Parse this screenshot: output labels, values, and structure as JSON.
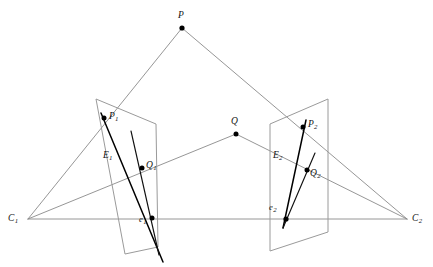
{
  "figure": {
    "type": "geometry-diagram",
    "width": 433,
    "height": 267,
    "background_color": "#ffffff",
    "stroke_color_structure": "#8a8a8a",
    "stroke_color_epipolar": "#000000"
  },
  "labels": {
    "P": {
      "text": "P",
      "sub": ""
    },
    "Q": {
      "text": "Q",
      "sub": ""
    },
    "C1": {
      "text": "C",
      "sub": "1"
    },
    "C2": {
      "text": "C",
      "sub": "2"
    },
    "P1": {
      "text": "P",
      "sub": "1"
    },
    "P2": {
      "text": "P",
      "sub": "2"
    },
    "Q1": {
      "text": "Q",
      "sub": "1"
    },
    "Q2": {
      "text": "Q",
      "sub": "2"
    },
    "E1": {
      "text": "E",
      "sub": "1"
    },
    "E2": {
      "text": "E",
      "sub": "2"
    },
    "e1": {
      "text": "e",
      "sub": "1"
    },
    "e2": {
      "text": "e",
      "sub": "2"
    }
  },
  "points": {
    "P": {
      "x": 182,
      "y": 28,
      "dot": true
    },
    "Q": {
      "x": 236,
      "y": 134,
      "dot": true
    },
    "C1": {
      "x": 28,
      "y": 219,
      "dot": false
    },
    "C2": {
      "x": 407,
      "y": 219,
      "dot": false
    },
    "P1": {
      "x": 104,
      "y": 118,
      "dot": true
    },
    "Q1": {
      "x": 142,
      "y": 168,
      "dot": true
    },
    "e1": {
      "x": 152,
      "y": 218,
      "dot": true
    },
    "P2": {
      "x": 303,
      "y": 127,
      "dot": true
    },
    "Q2": {
      "x": 307,
      "y": 170,
      "dot": true
    },
    "e2": {
      "x": 286,
      "y": 219,
      "dot": true
    }
  },
  "planes": {
    "left_image_plane": {
      "name": "left-image-plane",
      "corners": [
        [
          96,
          99
        ],
        [
          156,
          124
        ],
        [
          158,
          247
        ],
        [
          125,
          254
        ]
      ]
    },
    "right_image_plane": {
      "name": "right-image-plane",
      "corners": [
        [
          270,
          124
        ],
        [
          328,
          99
        ],
        [
          328,
          232
        ],
        [
          270,
          251
        ]
      ]
    }
  },
  "structure_lines": [
    {
      "name": "ray-C1-to-P",
      "from": [
        28,
        219
      ],
      "to": [
        182,
        28
      ]
    },
    {
      "name": "ray-C2-to-P",
      "from": [
        407,
        219
      ],
      "to": [
        182,
        28
      ]
    },
    {
      "name": "ray-C1-to-Q",
      "from": [
        28,
        219
      ],
      "to": [
        236,
        134
      ]
    },
    {
      "name": "ray-C2-to-Q",
      "from": [
        407,
        219
      ],
      "to": [
        236,
        134
      ]
    },
    {
      "name": "baseline-C1-C2",
      "from": [
        28,
        219
      ],
      "to": [
        407,
        219
      ]
    }
  ],
  "epipolar_lines": [
    {
      "name": "epipolar-line-E1",
      "from": [
        101,
        113
      ],
      "to": [
        163,
        262
      ],
      "thick": true
    },
    {
      "name": "epipolar-line-E2",
      "from": [
        283,
        228
      ],
      "to": [
        306,
        120
      ],
      "thick": true
    },
    {
      "name": "line-Q1-to-e1",
      "from": [
        131,
        131
      ],
      "to": [
        159,
        255
      ],
      "thick": false
    },
    {
      "name": "line-e2-to-Q2",
      "from": [
        283,
        228
      ],
      "to": [
        315,
        153
      ],
      "thick": false
    }
  ],
  "label_positions": {
    "P": {
      "x": 178,
      "y": 11
    },
    "Q": {
      "x": 231,
      "y": 117
    },
    "C1": {
      "x": 11,
      "y": 219
    },
    "C2": {
      "x": 412,
      "y": 219
    },
    "P1": {
      "x": 110,
      "y": 113
    },
    "Q1": {
      "x": 146,
      "y": 163
    },
    "E1": {
      "x": 104,
      "y": 152
    },
    "e1": {
      "x": 140,
      "y": 219
    },
    "P2": {
      "x": 308,
      "y": 122
    },
    "Q2": {
      "x": 310,
      "y": 170
    },
    "E2": {
      "x": 274,
      "y": 152
    },
    "e2": {
      "x": 270,
      "y": 205
    }
  }
}
